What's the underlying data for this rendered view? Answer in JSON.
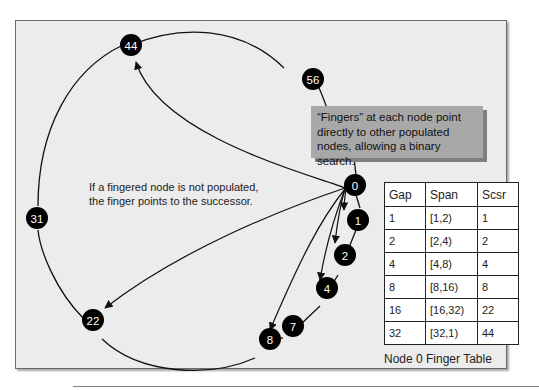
{
  "diagram": {
    "type": "chord-ring",
    "nodes": [
      {
        "id": "0",
        "label": "0"
      },
      {
        "id": "1",
        "label": "1"
      },
      {
        "id": "2",
        "label": "2"
      },
      {
        "id": "4",
        "label": "4"
      },
      {
        "id": "7",
        "label": "7"
      },
      {
        "id": "8",
        "label": "8"
      },
      {
        "id": "22",
        "label": "22"
      },
      {
        "id": "31",
        "label": "31"
      },
      {
        "id": "44",
        "label": "44"
      },
      {
        "id": "56",
        "label": "56"
      }
    ],
    "finger_edges": [
      {
        "from": "0",
        "to": "1"
      },
      {
        "from": "0",
        "to": "2"
      },
      {
        "from": "0",
        "to": "4"
      },
      {
        "from": "0",
        "to": "8"
      },
      {
        "from": "0",
        "to": "22"
      },
      {
        "from": "0",
        "to": "44"
      }
    ],
    "colors": {
      "node_fill": "#000000",
      "node_text": "#ffffff",
      "panel_bg": "#ececec",
      "callout_bg": "#a8a8a8"
    }
  },
  "note": {
    "line1": "If a fingered node is not populated,",
    "line2": "the finger points to the successor."
  },
  "callout": {
    "line1": "“Fingers” at each node point",
    "line2": "directly to other populated",
    "line3": "nodes, allowing a binary search."
  },
  "finger_table": {
    "caption": "Node 0 Finger Table",
    "headers": [
      "Gap",
      "Span",
      "Scsr"
    ],
    "rows": [
      [
        "1",
        "[1,2)",
        "1"
      ],
      [
        "2",
        "[2,4)",
        "2"
      ],
      [
        "4",
        "[4,8)",
        "4"
      ],
      [
        "8",
        "[8,16)",
        "8"
      ],
      [
        "16",
        "[16,32)",
        "22"
      ],
      [
        "32",
        "[32,1)",
        "44"
      ]
    ]
  }
}
